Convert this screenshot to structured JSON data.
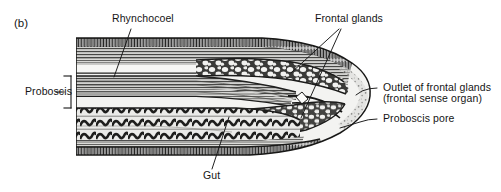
{
  "figure": {
    "panel_letter": "(b)",
    "style": "grayscale-engraving",
    "background_color": "#ffffff",
    "ink_color": "#151515"
  },
  "labels": {
    "rhynchocoel": "Rhynchocoel",
    "frontal_glands": "Frontal glands",
    "proboscis": "Proboscis",
    "outlet_line1": "Outlet of frontal glands",
    "outlet_line2": "(frontal sense organ)",
    "proboscis_pore": "Proboscis pore",
    "gut": "Gut"
  },
  "leader_lines": [
    {
      "name": "rhynchocoel-leader",
      "x1": 131,
      "y1": 29,
      "x2": 114,
      "y2": 77
    },
    {
      "name": "frontal-glands-leader-upper",
      "x1": 339,
      "y1": 29,
      "x2": 291,
      "y2": 73
    },
    {
      "name": "frontal-glands-leader-lower",
      "x1": 341,
      "y1": 29,
      "x2": 301,
      "y2": 118
    },
    {
      "name": "outlet-leader",
      "x1": 377,
      "y1": 88,
      "x2": 356,
      "y2": 95
    },
    {
      "name": "proboscis-pore-leader",
      "x1": 377,
      "y1": 119,
      "x2": 340,
      "y2": 128
    },
    {
      "name": "gut-leader",
      "x1": 212,
      "y1": 169,
      "x2": 229,
      "y2": 117
    }
  ],
  "proboscis_bracket": {
    "x": 71,
    "y_top": 76,
    "y_bottom": 108,
    "arm": 7,
    "tick_y": 92
  },
  "anatomy": {
    "regions": [
      "ciliated-epidermis-dorsal",
      "body-wall-musculature",
      "rhynchocoel-lumen",
      "proboscis-layers",
      "frontal-gland-mass-dorsal",
      "frontal-gland-mass-ventral",
      "proboscis-pore-channel",
      "gut-lumen-with-folds",
      "ciliated-epidermis-ventral"
    ]
  }
}
